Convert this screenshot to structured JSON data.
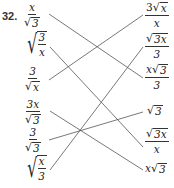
{
  "problem_number": "32.",
  "left_column": [
    {
      "id": "L1",
      "num": "x",
      "den_rad": "3",
      "label": "x/√3"
    },
    {
      "id": "L2",
      "rad_num": "3",
      "rad_den": "x",
      "label": "√(3/x)"
    },
    {
      "id": "L3",
      "num": "3",
      "den_rad": "x",
      "label": "3/√x"
    },
    {
      "id": "L4",
      "num": "3x",
      "den_rad": "3",
      "label": "3x/√3"
    },
    {
      "id": "L5",
      "num": "3",
      "den_rad": "3",
      "label": "3/√3"
    },
    {
      "id": "L6",
      "rad_num": "x",
      "rad_den": "3",
      "label": "√(x/3)"
    }
  ],
  "right_column": [
    {
      "id": "R1",
      "num_coef": "3",
      "num_rad": "x",
      "den": "x",
      "label": "3√x/x"
    },
    {
      "id": "R2",
      "num_rad": "3x",
      "den": "3",
      "label": "√3x/3"
    },
    {
      "id": "R3",
      "num_coef": "x",
      "num_rad": "3",
      "den": "3",
      "label": "x√3/3"
    },
    {
      "id": "R4",
      "rad": "3",
      "label": "√3"
    },
    {
      "id": "R5",
      "num_rad": "3x",
      "den": "x",
      "label": "√3x/x"
    },
    {
      "id": "R6",
      "coef": "x",
      "rad": "3",
      "label": "x√3"
    }
  ],
  "matches": [
    {
      "from": "L1",
      "to": "R3"
    },
    {
      "from": "L2",
      "to": "R5"
    },
    {
      "from": "L3",
      "to": "R1"
    },
    {
      "from": "L4",
      "to": "R6"
    },
    {
      "from": "L5",
      "to": "R4"
    },
    {
      "from": "L6",
      "to": "R2"
    }
  ],
  "symbols": {
    "sqrt": "√"
  },
  "colors": {
    "line": "#555555",
    "text": "#222222"
  }
}
